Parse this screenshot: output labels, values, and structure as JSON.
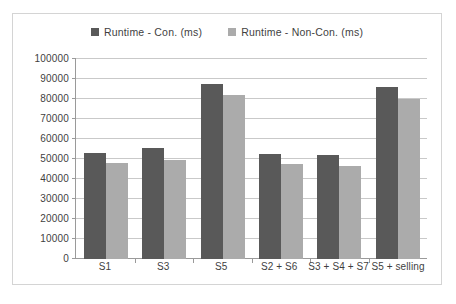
{
  "chart_data": {
    "type": "bar",
    "title": "",
    "xlabel": "",
    "ylabel": "",
    "ylim": [
      0,
      100000
    ],
    "ytick_step": 10000,
    "grid": true,
    "legend_position": "top-center",
    "categories": [
      "S1",
      "S3",
      "S5",
      "S2 + S6",
      "S3 + S4 + S7",
      "S5 + selling"
    ],
    "y_tick_labels": [
      "100000",
      "90000",
      "80000",
      "70000",
      "60000",
      "50000",
      "40000",
      "30000",
      "20000",
      "10000",
      "0"
    ],
    "series": [
      {
        "name": "Runtime - Con. (ms)",
        "color": "#595959",
        "values": [
          53200,
          55700,
          87600,
          52700,
          52200,
          86000
        ]
      },
      {
        "name": "Runtime - Non-Con. (ms)",
        "color": "#ababab",
        "values": [
          47800,
          49700,
          82100,
          47300,
          46300,
          80100
        ]
      }
    ]
  },
  "colors": {
    "series_con": "#595959",
    "series_noncon": "#ababab",
    "gridline": "#c9c9c9",
    "axis": "#9a9a9a",
    "frame_border": "#d4d4d4",
    "text": "#3f3f3f"
  }
}
